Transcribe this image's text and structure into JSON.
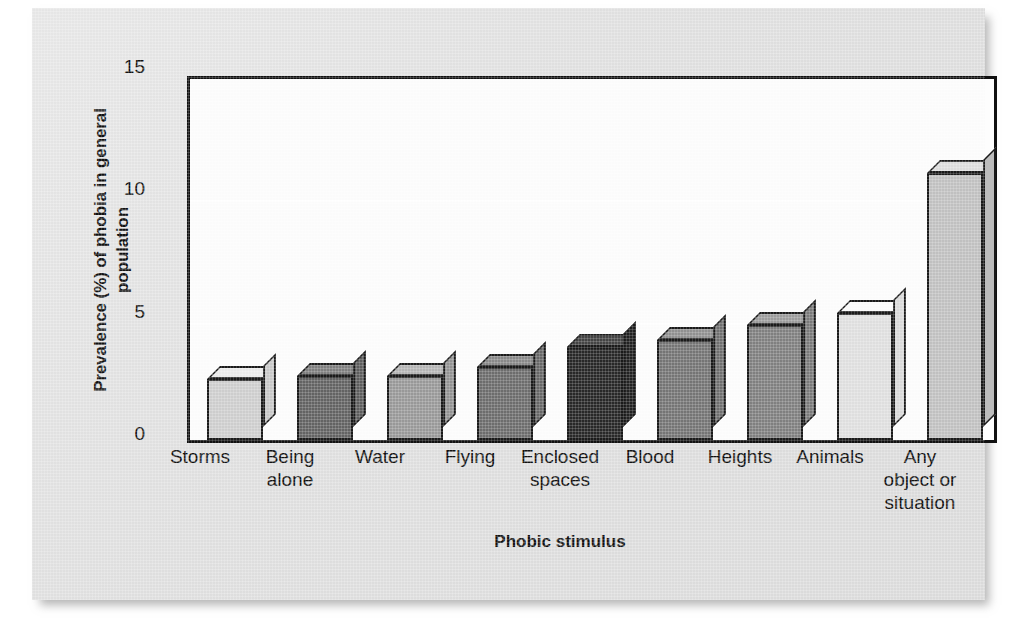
{
  "chart_data": {
    "type": "bar",
    "title": "",
    "xlabel": "Phobic stimulus",
    "ylabel_line1": "Prevalence (%) of phobia in general",
    "ylabel_line2": "population",
    "ylabel": "Prevalence (%) of phobia in general population",
    "categories": [
      "Storms",
      "Being alone",
      "Water",
      "Flying",
      "Enclosed spaces",
      "Blood",
      "Heights",
      "Animals",
      "Any object or situation"
    ],
    "category_lines": [
      [
        "Storms"
      ],
      [
        "Being",
        "alone"
      ],
      [
        "Water"
      ],
      [
        "Flying"
      ],
      [
        "Enclosed",
        "spaces"
      ],
      [
        "Blood"
      ],
      [
        "Heights"
      ],
      [
        "Animals"
      ],
      [
        "Any",
        "object or",
        "situation"
      ]
    ],
    "values": [
      2.5,
      2.6,
      2.6,
      3.0,
      3.8,
      4.1,
      4.7,
      5.2,
      10.9
    ],
    "bar_colors": [
      "#cfcfcf",
      "#646464",
      "#9a9a9a",
      "#6e6e6e",
      "#282828",
      "#767676",
      "#818181",
      "#e0e0e0",
      "#c2c2c2"
    ],
    "ylim": [
      0,
      15
    ],
    "yticks": [
      0,
      5,
      10,
      15
    ],
    "ytick_labels": [
      "0",
      "5",
      "10",
      "15"
    ],
    "grid": true,
    "legend": "none"
  }
}
